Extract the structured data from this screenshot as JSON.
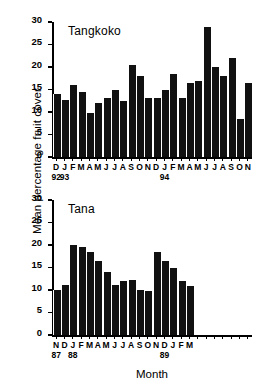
{
  "figure": {
    "ylabel": "Mean percentage fruit cover",
    "xlabel": "Month"
  },
  "chart_data": [
    {
      "type": "bar",
      "title": "Tangkoko",
      "xlabel": "",
      "ylabel": "Mean percentage fruit cover",
      "ylim": [
        0,
        30
      ],
      "yticks": [
        0,
        5,
        10,
        15,
        20,
        25,
        30
      ],
      "ytick_labels": [
        "0",
        "5",
        "10",
        "15",
        "20",
        "25",
        "30"
      ],
      "grid": false,
      "legend": null,
      "categories": [
        "D",
        "J",
        "F",
        "M",
        "A",
        "M",
        "J",
        "J",
        "A",
        "S",
        "O",
        "N",
        "D",
        "J",
        "F",
        "M",
        "A",
        "M",
        "J",
        "J",
        "A",
        "S",
        "O",
        "N"
      ],
      "values": [
        14.0,
        12.6,
        16.0,
        14.5,
        9.8,
        12.1,
        13.1,
        14.8,
        12.5,
        20.4,
        18.0,
        13.1,
        13.1,
        14.8,
        18.4,
        13.1,
        16.4,
        16.8,
        29.0,
        20.0,
        18.0,
        22.0,
        8.4,
        16.5
      ],
      "year_marks": [
        {
          "label": "92",
          "index": 0
        },
        {
          "label": "93",
          "index": 1
        },
        {
          "label": "94",
          "index": 13
        }
      ]
    },
    {
      "type": "bar",
      "title": "Tana",
      "xlabel": "Month",
      "ylabel": "Mean percentage fruit cover",
      "ylim": [
        0,
        30
      ],
      "yticks": [
        0,
        5,
        10,
        15,
        20,
        25,
        30
      ],
      "ytick_labels": [
        "0",
        "5",
        "10",
        "15",
        "20",
        "25",
        "30"
      ],
      "grid": false,
      "legend": null,
      "categories": [
        "N",
        "D",
        "J",
        "F",
        "M",
        "A",
        "M",
        "J",
        "J",
        "A",
        "S",
        "O",
        "N",
        "D",
        "J",
        "F",
        "M"
      ],
      "values": [
        10.0,
        11.1,
        20.0,
        19.5,
        18.5,
        16.5,
        14.0,
        11.1,
        12.0,
        12.2,
        10.0,
        9.7,
        18.4,
        16.5,
        14.8,
        12.0,
        11.0
      ],
      "axis_slots": 24,
      "year_marks": [
        {
          "label": "87",
          "index": 0
        },
        {
          "label": "88",
          "index": 2
        },
        {
          "label": "89",
          "index": 13
        }
      ]
    }
  ]
}
